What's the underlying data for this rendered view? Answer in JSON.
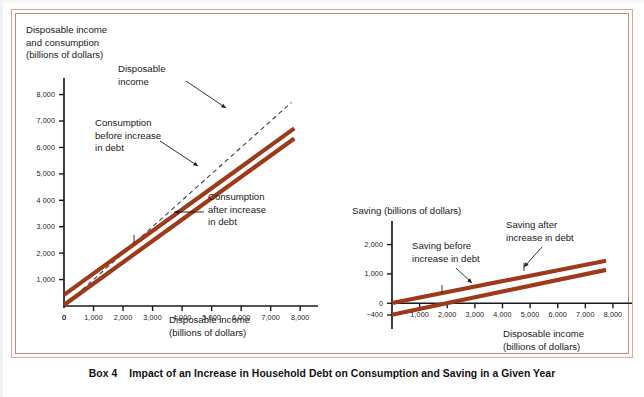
{
  "caption": {
    "box_label": "Box 4",
    "title": "Impact of an Increase in Household Debt on Consumption and Saving in a Given Year"
  },
  "theme": {
    "line_color": "#9c3a1b",
    "dash_color": "#3a3a52",
    "frame_outer": "#d8a894",
    "frame_inner": "#c08a74",
    "axis_color": "#1a1a1a"
  },
  "left_chart": {
    "y_axis_title": "Disposable income\nand consumption\n(billions of dollars)",
    "x_axis_title": "Disposable income\n(billions of dollars)",
    "y_ticks": [
      "1,000",
      "2,000",
      "3,000",
      "4 000",
      "5,000",
      "6,000",
      "7,000",
      "8,000"
    ],
    "x_ticks": [
      "0",
      "1,000",
      "2,000",
      "3,000",
      "4,000",
      "5,000",
      "6,000",
      "7,000",
      "8,000"
    ],
    "annotations": [
      {
        "name": "disposable-income",
        "text": "Disposable\nincome"
      },
      {
        "name": "consumption-before",
        "text": "Consumption\nbefore increase\nin debt"
      },
      {
        "name": "consumption-after",
        "text": "Consumption\nafter increase\nin debt"
      }
    ]
  },
  "right_chart": {
    "y_axis_title": "Saving (billions of dollars)",
    "x_axis_title": "Disposable income\n(billions of dollars)",
    "y_ticks": [
      "0",
      "1,000",
      "2,000"
    ],
    "y_tick_extra": "−400",
    "x_ticks": [
      "1,000",
      "2,000",
      "3,000",
      "4,000",
      "5,000",
      "6,000",
      "7,000",
      "8,000"
    ],
    "annotations": [
      {
        "name": "saving-before",
        "text": "Saving before\nincrease in debt"
      },
      {
        "name": "saving-after",
        "text": "Saving after\nincrease in debt"
      }
    ]
  },
  "chart_data": [
    {
      "id": "left",
      "type": "line",
      "title": "Impact of an Increase in Household Debt on Consumption",
      "xlabel": "Disposable income (billions of dollars)",
      "ylabel": "Disposable income and consumption (billions of dollars)",
      "xlim": [
        0,
        8400
      ],
      "ylim": [
        0,
        8400
      ],
      "xticks": [
        0,
        1000,
        2000,
        3000,
        4000,
        5000,
        6000,
        7000,
        8000
      ],
      "yticks": [
        1000,
        2000,
        3000,
        4000,
        5000,
        6000,
        7000,
        8000
      ],
      "grid": false,
      "legend": "annotations-inline",
      "series": [
        {
          "name": "Disposable income",
          "style": "dashed",
          "color": "#3a3a52",
          "x": [
            0,
            7700
          ],
          "y": [
            0,
            7700
          ]
        },
        {
          "name": "Consumption before increase in debt",
          "style": "solid-thick",
          "color": "#9c3a1b",
          "x": [
            0,
            7800
          ],
          "y": [
            420,
            6720
          ]
        },
        {
          "name": "Consumption after increase in debt",
          "style": "solid-thick",
          "color": "#9c3a1b",
          "x": [
            0,
            7800
          ],
          "y": [
            40,
            6340
          ]
        }
      ]
    },
    {
      "id": "right",
      "type": "line",
      "title": "Impact of an Increase in Household Debt on Saving",
      "xlabel": "Disposable income (billions of dollars)",
      "ylabel": "Saving (billions of dollars)",
      "xlim": [
        0,
        8400
      ],
      "ylim": [
        -400,
        2600
      ],
      "xticks": [
        1000,
        2000,
        3000,
        4000,
        5000,
        6000,
        7000,
        8000
      ],
      "yticks": [
        0,
        1000,
        2000
      ],
      "grid": false,
      "legend": "annotations-inline",
      "series": [
        {
          "name": "Saving before increase in debt",
          "style": "solid-thick",
          "color": "#9c3a1b",
          "x": [
            0,
            7750
          ],
          "y": [
            10,
            1450
          ]
        },
        {
          "name": "Saving after increase in debt",
          "style": "solid-thick",
          "color": "#9c3a1b",
          "x": [
            0,
            7750
          ],
          "y": [
            -390,
            1140
          ]
        }
      ]
    }
  ]
}
